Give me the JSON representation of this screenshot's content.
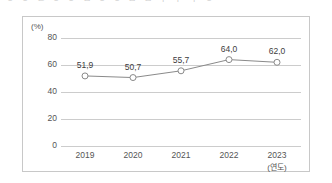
{
  "page": {
    "clipped_heading_text": "ㅇ ㅇ ㄴ  ㅇ ㅇ ㅁ  ㅇ ㅇ ㅁ  ㅁ ㅣ ㅏ  ㅣ ㅇ"
  },
  "chart_data": {
    "type": "line",
    "title": "",
    "xlabel": "(연도)",
    "ylabel": "(%)",
    "unit_label": "(%)",
    "x_unit_label": "(연도)",
    "categories": [
      "2019",
      "2020",
      "2021",
      "2022",
      "2023"
    ],
    "values": [
      51.9,
      50.7,
      55.7,
      64.0,
      62.0
    ],
    "data_labels": [
      "51,9",
      "50,7",
      "55,7",
      "64,0",
      "62,0"
    ],
    "ylim": [
      0,
      80
    ],
    "y_ticks": [
      0,
      20,
      40,
      60,
      80
    ],
    "y_tick_labels": [
      "0",
      "20",
      "40",
      "60",
      "80"
    ],
    "grid": true,
    "legend": "none",
    "series_color": "#8a8a8a",
    "marker": "open-circle",
    "grid_color": "#cccccc"
  }
}
